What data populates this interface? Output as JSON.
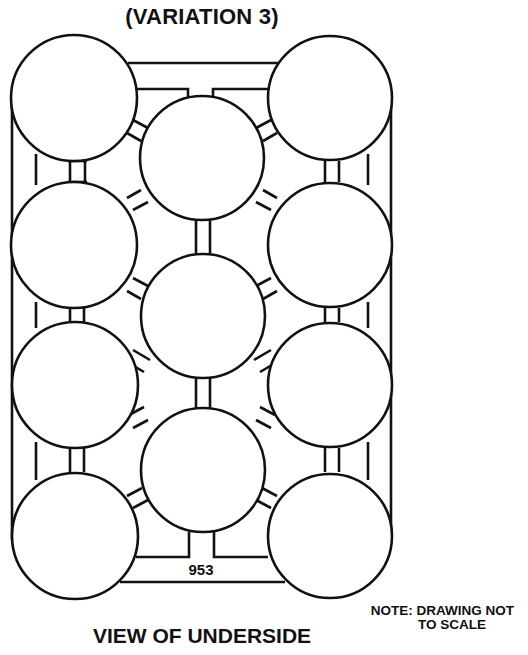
{
  "title": "(VARIATION 3)",
  "label_part_number": "953",
  "footer": "VIEW OF UNDERSIDE",
  "note": {
    "line1": "NOTE: DRAWING NOT",
    "line2": "TO SCALE"
  },
  "colors": {
    "line": "#111111",
    "background": "#ffffff"
  },
  "layout": {
    "columns": [
      "left",
      "middle",
      "right"
    ],
    "left_column_circles": 4,
    "middle_column_circles": 3,
    "right_column_circles": 4,
    "total_circles": 11
  }
}
